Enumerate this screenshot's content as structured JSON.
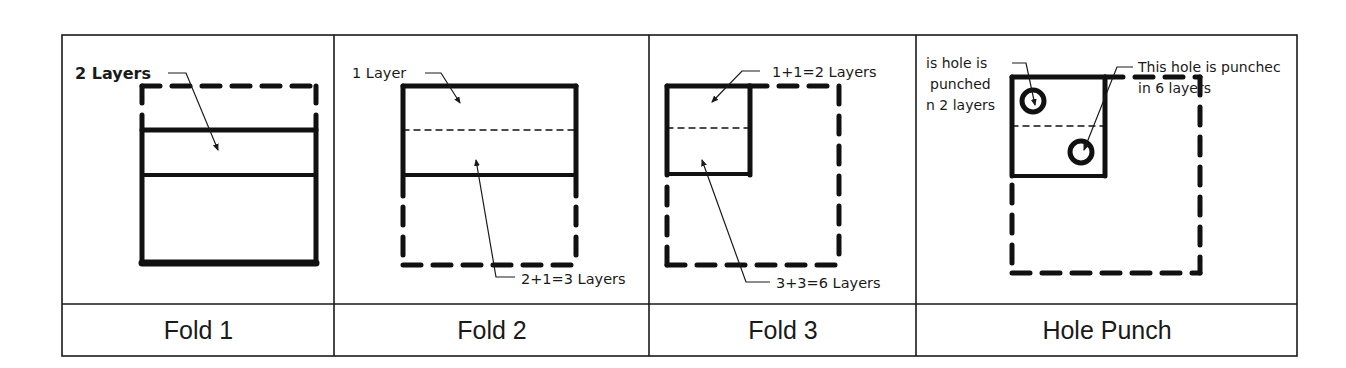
{
  "figure": {
    "panels": [
      {
        "caption": "Fold 1",
        "labels": [
          "2 Layers"
        ]
      },
      {
        "caption": "Fold 2",
        "labels": [
          "1 Layer",
          "2+1=3 Layers"
        ]
      },
      {
        "caption": "Fold 3",
        "labels": [
          "1+1=2 Layers",
          "3+3=6 Layers"
        ]
      },
      {
        "caption": "Hole Punch",
        "labels": {
          "left_line1": "is hole is",
          "left_line2": "punched",
          "left_line3": "n 2 layers",
          "right_line1": "This hole is punchec",
          "right_line2": "in 6 layers"
        }
      }
    ]
  }
}
